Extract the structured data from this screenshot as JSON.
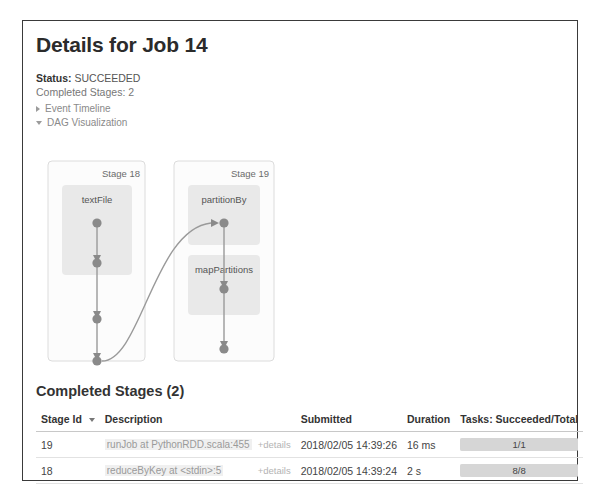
{
  "page": {
    "title": "Details for Job 14"
  },
  "summary": {
    "status_label": "Status:",
    "status_value": "SUCCEEDED",
    "completed_stages_line": "Completed Stages: 2"
  },
  "toggles": [
    {
      "label": "Event Timeline",
      "expanded": false,
      "icon": "triangle-right-icon"
    },
    {
      "label": "DAG Visualization",
      "expanded": true,
      "icon": "triangle-down-icon"
    }
  ],
  "dag": {
    "stages": [
      {
        "title": "Stage 18",
        "rdds": [
          {
            "label": "textFile"
          }
        ],
        "node_count": 4
      },
      {
        "title": "Stage 19",
        "rdds": [
          {
            "label": "partitionBy"
          },
          {
            "label": "mapPartitions"
          }
        ],
        "node_count": 3
      }
    ],
    "colors": {
      "stage_border": "#d9d9d9",
      "stage_fill": "#fcfcfc",
      "rdd_fill": "#e9e9e9",
      "node_fill": "#8a8a8a",
      "edge_stroke": "#9a9a9a",
      "label_color": "#6b6b6b"
    }
  },
  "stages_section": {
    "heading": "Completed Stages (2)",
    "columns": [
      "Stage Id",
      "Description",
      "Submitted",
      "Duration",
      "Tasks: Succeeded/Total"
    ],
    "sort_column": "Stage Id",
    "details_label": "+details",
    "rows": [
      {
        "stage_id": "19",
        "description": "runJob at PythonRDD.scala:455",
        "details": "+details",
        "submitted": "2018/02/05 14:39:26",
        "duration": "16 ms",
        "tasks": "1/1",
        "progress_pct": 100
      },
      {
        "stage_id": "18",
        "description": "reduceByKey at <stdin>:5",
        "details": "+details",
        "submitted": "2018/02/05 14:39:24",
        "duration": "2 s",
        "tasks": "8/8",
        "progress_pct": 100
      }
    ]
  }
}
